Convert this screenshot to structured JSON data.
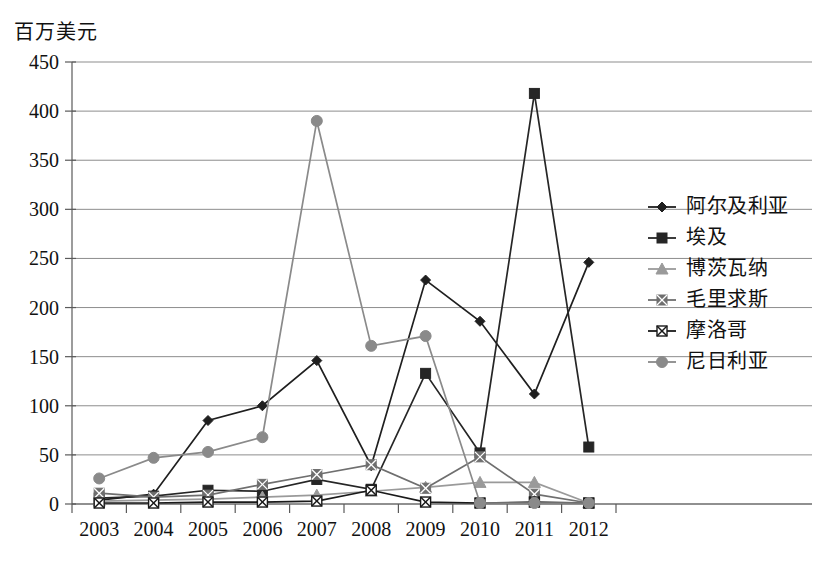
{
  "chart_data": {
    "type": "line",
    "title": "",
    "ylabel": "百万美元",
    "xlabel": "",
    "ylim": [
      0,
      450
    ],
    "ytick_step": 50,
    "yticks": [
      "0",
      "50",
      "100",
      "150",
      "200",
      "250",
      "300",
      "350",
      "400",
      "450"
    ],
    "grid": true,
    "legend_position": "right",
    "categories": [
      "2003",
      "2004",
      "2005",
      "2006",
      "2007",
      "2008",
      "2009",
      "2010",
      "2011",
      "2012"
    ],
    "series": [
      {
        "name": "阿尔及利亚",
        "marker": "diamond",
        "color": "#1f1f1f",
        "values": [
          4,
          10,
          85,
          100,
          146,
          39,
          228,
          186,
          112,
          246
        ]
      },
      {
        "name": "埃及",
        "marker": "square",
        "color": "#262626",
        "values": [
          6,
          8,
          14,
          13,
          25,
          15,
          133,
          52,
          418,
          58
        ]
      },
      {
        "name": "博茨瓦纳",
        "marker": "triangle",
        "color": "#9a9a9a",
        "values": [
          3,
          4,
          5,
          7,
          9,
          13,
          17,
          22,
          22,
          1
        ]
      },
      {
        "name": "毛里求斯",
        "marker": "x-square",
        "color": "#6f6f6f",
        "values": [
          11,
          7,
          9,
          20,
          30,
          40,
          16,
          48,
          10,
          1
        ]
      },
      {
        "name": "摩洛哥",
        "marker": "crossed-box",
        "color": "#1a1a1a",
        "values": [
          1,
          1,
          2,
          2,
          3,
          14,
          2,
          1,
          2,
          1
        ]
      },
      {
        "name": "尼日利亚",
        "marker": "circle",
        "color": "#8a8a8a",
        "values": [
          26,
          47,
          53,
          68,
          390,
          161,
          171,
          1,
          1,
          1
        ]
      }
    ]
  },
  "legend": {
    "entries": [
      {
        "label": "阿尔及利亚"
      },
      {
        "label": "埃及"
      },
      {
        "label": "博茨瓦纳"
      },
      {
        "label": "毛里求斯"
      },
      {
        "label": "摩洛哥"
      },
      {
        "label": "尼日利亚"
      }
    ]
  }
}
